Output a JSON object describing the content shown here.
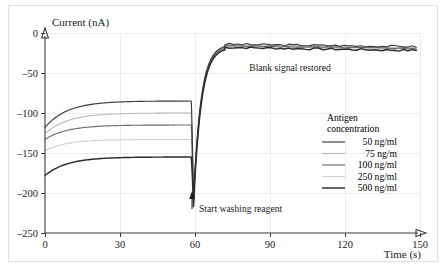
{
  "figure": {
    "background_color": "#ffffff",
    "frame_color": "#e2e2e2"
  },
  "chart_data": {
    "type": "line",
    "title": "",
    "xlabel": "Time (s)",
    "ylabel": "Current (nA)",
    "xlim": [
      0,
      150
    ],
    "ylim": [
      -250,
      0
    ],
    "xticks": [
      0,
      30,
      60,
      90,
      120,
      150
    ],
    "xtick_labels": [
      "0",
      "30",
      "60",
      "90",
      "120",
      "150"
    ],
    "yticks": [
      0,
      -50,
      -100,
      -150,
      -200,
      -250
    ],
    "ytick_labels": [
      "0",
      "–50",
      "–100",
      "–150",
      "–200",
      "–250"
    ],
    "grid": true,
    "grid_color": "#ececec",
    "legend_position": "right-middle",
    "legend_title_line1": "Antigen",
    "legend_title_line2": "concentration",
    "annotations": [
      {
        "name": "blank-signal-restored",
        "text": "Blank signal restored",
        "x": 96,
        "y": -40
      },
      {
        "name": "start-washing-reagent",
        "text": "Start washing reagent",
        "x": 62,
        "y": -222,
        "arrow": "up",
        "arrow_x": 59
      }
    ],
    "series": [
      {
        "name": "50 ng/ml",
        "label": "50 ng/ml",
        "color": "#3c3c3c",
        "width": 1.15,
        "plateau": -85,
        "start": -118,
        "spike_min": -205,
        "recover": -14
      },
      {
        "name": "75 ng/m",
        "label": "75 ng/m",
        "color": "#b6b6b6",
        "width": 1.05,
        "plateau": -100,
        "start": -126,
        "spike_min": -208,
        "recover": -15
      },
      {
        "name": "100 ng/ml",
        "label": "100 ng/ml",
        "color": "#6e6e6e",
        "width": 1.15,
        "plateau": -115,
        "start": -133,
        "spike_min": -212,
        "recover": -16
      },
      {
        "name": "250 ng/ml",
        "label": "250 ng/ml",
        "color": "#cfcfcf",
        "width": 1.05,
        "plateau": -133,
        "start": -147,
        "spike_min": -214,
        "recover": -17
      },
      {
        "name": "500 ng/ml",
        "label": "500 ng/ml",
        "color": "#2b2b2b",
        "width": 1.45,
        "plateau": -155,
        "start": -178,
        "spike_min": -217,
        "recover": -18
      }
    ],
    "event": {
      "wash_start_time": 58.5,
      "spike_time": 59.4,
      "recovery_time": 72
    }
  }
}
